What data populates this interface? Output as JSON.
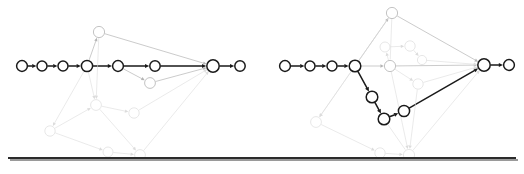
{
  "figure": {
    "type": "graph-pair",
    "background": "#ffffff",
    "panels": [
      "left",
      "right"
    ],
    "separator": {
      "name": "horizontal-rule",
      "y": 158,
      "x1": 8,
      "x2": 516,
      "color": "#2b2b2b",
      "thickness": 2.0,
      "shadow_color": "#9a9a9a",
      "shadow_offset": 2
    },
    "node": {
      "radius": 5.4,
      "radius_large": 6.2,
      "radius_small": 4.6,
      "fill": "#ffffff"
    },
    "colors": {
      "active_stroke": "#1a1a1a",
      "mid_stroke": "#b4b4b4",
      "faint_stroke": "#dcdcdc",
      "very_faint_stroke": "#ececec"
    },
    "stroke_widths": {
      "active": 1.5,
      "mid": 0.7,
      "faint": 0.6
    }
  },
  "chart_data": {
    "type": "diagram-graph",
    "title": "",
    "panels": [
      {
        "id": "left",
        "name": "left-graph",
        "origin_x": 0,
        "nodes": [
          {
            "id": "L0",
            "x": 22,
            "y": 66,
            "r": 5.4,
            "class": "active"
          },
          {
            "id": "L1",
            "x": 42,
            "y": 66,
            "r": 5.0,
            "class": "active"
          },
          {
            "id": "L2",
            "x": 63,
            "y": 66,
            "r": 5.0,
            "class": "active"
          },
          {
            "id": "L3",
            "x": 87,
            "y": 66,
            "r": 5.6,
            "class": "active"
          },
          {
            "id": "L4",
            "x": 118,
            "y": 66,
            "r": 5.4,
            "class": "active"
          },
          {
            "id": "L5",
            "x": 155,
            "y": 66,
            "r": 5.2,
            "class": "active"
          },
          {
            "id": "L6",
            "x": 213,
            "y": 66,
            "r": 6.2,
            "class": "active"
          },
          {
            "id": "L7",
            "x": 240,
            "y": 66,
            "r": 5.2,
            "class": "active"
          },
          {
            "id": "L8",
            "x": 99,
            "y": 32,
            "r": 5.6,
            "class": "mid"
          },
          {
            "id": "L9",
            "x": 150,
            "y": 83,
            "r": 5.4,
            "class": "mid"
          },
          {
            "id": "L10",
            "x": 96,
            "y": 105,
            "r": 5.4,
            "class": "faint"
          },
          {
            "id": "L11",
            "x": 134,
            "y": 113,
            "r": 5.2,
            "class": "faint"
          },
          {
            "id": "L12",
            "x": 50,
            "y": 131,
            "r": 5.2,
            "class": "faint"
          },
          {
            "id": "L13",
            "x": 108,
            "y": 152,
            "r": 5.0,
            "class": "faint"
          },
          {
            "id": "L14",
            "x": 140,
            "y": 155,
            "r": 5.4,
            "class": "faint"
          }
        ],
        "edges": [
          {
            "from": "L0",
            "to": "L1",
            "class": "active",
            "arrow": true
          },
          {
            "from": "L1",
            "to": "L2",
            "class": "active",
            "arrow": true
          },
          {
            "from": "L2",
            "to": "L3",
            "class": "active",
            "arrow": true
          },
          {
            "from": "L3",
            "to": "L4",
            "class": "active",
            "arrow": true
          },
          {
            "from": "L4",
            "to": "L5",
            "class": "active",
            "arrow": true
          },
          {
            "from": "L5",
            "to": "L6",
            "class": "active",
            "arrow": true
          },
          {
            "from": "L6",
            "to": "L7",
            "class": "active",
            "arrow": true
          },
          {
            "from": "L3",
            "to": "L8",
            "class": "mid",
            "arrow": true
          },
          {
            "from": "L8",
            "to": "L6",
            "class": "mid",
            "arrow": true
          },
          {
            "from": "L4",
            "to": "L9",
            "class": "mid",
            "arrow": true
          },
          {
            "from": "L9",
            "to": "L6",
            "class": "mid",
            "arrow": true
          },
          {
            "from": "L3",
            "to": "L10",
            "class": "faint",
            "arrow": true
          },
          {
            "from": "L3",
            "to": "L12",
            "class": "faint",
            "arrow": true
          },
          {
            "from": "L8",
            "to": "L10",
            "class": "faint",
            "arrow": true
          },
          {
            "from": "L10",
            "to": "L11",
            "class": "faint",
            "arrow": true
          },
          {
            "from": "L11",
            "to": "L6",
            "class": "faint",
            "arrow": true
          },
          {
            "from": "L12",
            "to": "L13",
            "class": "faint",
            "arrow": true
          },
          {
            "from": "L13",
            "to": "L14",
            "class": "faint",
            "arrow": true
          },
          {
            "from": "L14",
            "to": "L6",
            "class": "faint",
            "arrow": true
          },
          {
            "from": "L10",
            "to": "L14",
            "class": "faint",
            "arrow": true
          },
          {
            "from": "L12",
            "to": "L10",
            "class": "faint",
            "arrow": true
          }
        ]
      },
      {
        "id": "right",
        "name": "right-graph",
        "origin_x": 262,
        "nodes": [
          {
            "id": "R0",
            "x": 23,
            "y": 66,
            "r": 5.4,
            "class": "active"
          },
          {
            "id": "R1",
            "x": 48,
            "y": 66,
            "r": 5.0,
            "class": "active"
          },
          {
            "id": "R2",
            "x": 70,
            "y": 66,
            "r": 5.0,
            "class": "active"
          },
          {
            "id": "R3",
            "x": 93,
            "y": 66,
            "r": 5.8,
            "class": "active"
          },
          {
            "id": "R4",
            "x": 110,
            "y": 97,
            "r": 5.8,
            "class": "active"
          },
          {
            "id": "R5",
            "x": 122,
            "y": 119,
            "r": 5.8,
            "class": "active"
          },
          {
            "id": "R6",
            "x": 142,
            "y": 111,
            "r": 5.6,
            "class": "active"
          },
          {
            "id": "R7",
            "x": 222,
            "y": 65,
            "r": 6.2,
            "class": "active"
          },
          {
            "id": "R8",
            "x": 247,
            "y": 65,
            "r": 5.4,
            "class": "active"
          },
          {
            "id": "R9",
            "x": 128,
            "y": 66,
            "r": 5.6,
            "class": "mid"
          },
          {
            "id": "R10",
            "x": 130,
            "y": 13,
            "r": 5.6,
            "class": "mid"
          },
          {
            "id": "R11",
            "x": 123,
            "y": 47,
            "r": 5.0,
            "class": "faint"
          },
          {
            "id": "R12",
            "x": 148,
            "y": 46,
            "r": 5.2,
            "class": "faint"
          },
          {
            "id": "R13",
            "x": 160,
            "y": 60,
            "r": 4.6,
            "class": "faint"
          },
          {
            "id": "R14",
            "x": 156,
            "y": 84,
            "r": 5.2,
            "class": "faint"
          },
          {
            "id": "R15",
            "x": 54,
            "y": 122,
            "r": 5.4,
            "class": "faint"
          },
          {
            "id": "R16",
            "x": 118,
            "y": 153,
            "r": 5.2,
            "class": "faint"
          },
          {
            "id": "R17",
            "x": 147,
            "y": 155,
            "r": 5.6,
            "class": "faint"
          }
        ],
        "edges": [
          {
            "from": "R0",
            "to": "R1",
            "class": "active",
            "arrow": true
          },
          {
            "from": "R1",
            "to": "R2",
            "class": "active",
            "arrow": true
          },
          {
            "from": "R2",
            "to": "R3",
            "class": "active",
            "arrow": true
          },
          {
            "from": "R3",
            "to": "R4",
            "class": "active",
            "arrow": true
          },
          {
            "from": "R4",
            "to": "R5",
            "class": "active",
            "arrow": true
          },
          {
            "from": "R5",
            "to": "R6",
            "class": "active",
            "arrow": true
          },
          {
            "from": "R6",
            "to": "R7",
            "class": "active",
            "arrow": true
          },
          {
            "from": "R7",
            "to": "R8",
            "class": "active",
            "arrow": true
          },
          {
            "from": "R3",
            "to": "R9",
            "class": "mid",
            "arrow": true
          },
          {
            "from": "R9",
            "to": "R7",
            "class": "mid",
            "arrow": true
          },
          {
            "from": "R3",
            "to": "R10",
            "class": "mid",
            "arrow": true
          },
          {
            "from": "R10",
            "to": "R7",
            "class": "mid",
            "arrow": true
          },
          {
            "from": "R11",
            "to": "R12",
            "class": "faint",
            "arrow": true
          },
          {
            "from": "R12",
            "to": "R13",
            "class": "faint",
            "arrow": true
          },
          {
            "from": "R9",
            "to": "R11",
            "class": "faint",
            "arrow": true
          },
          {
            "from": "R9",
            "to": "R14",
            "class": "faint",
            "arrow": true
          },
          {
            "from": "R14",
            "to": "R7",
            "class": "faint",
            "arrow": true
          },
          {
            "from": "R13",
            "to": "R7",
            "class": "faint",
            "arrow": true
          },
          {
            "from": "R3",
            "to": "R15",
            "class": "faint",
            "arrow": true
          },
          {
            "from": "R15",
            "to": "R16",
            "class": "faint",
            "arrow": true
          },
          {
            "from": "R16",
            "to": "R17",
            "class": "faint",
            "arrow": true
          },
          {
            "from": "R17",
            "to": "R7",
            "class": "faint",
            "arrow": true
          },
          {
            "from": "R9",
            "to": "R17",
            "class": "faint",
            "arrow": true
          },
          {
            "from": "R10",
            "to": "R15",
            "class": "faint",
            "arrow": true
          },
          {
            "from": "R14",
            "to": "R17",
            "class": "faint",
            "arrow": true
          },
          {
            "from": "R5",
            "to": "R17",
            "class": "faint",
            "arrow": false
          },
          {
            "from": "R10",
            "to": "R9",
            "class": "faint",
            "arrow": false
          }
        ]
      }
    ]
  }
}
